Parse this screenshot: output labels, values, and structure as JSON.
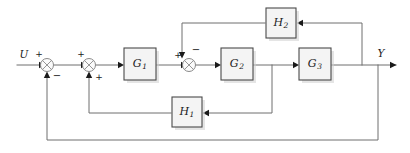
{
  "diagram": {
    "type": "control-system-block-diagram",
    "title": "",
    "input_label": "U",
    "output_label": "Y",
    "colors": {
      "background": "#ffffff",
      "wire": "#6f6f6f",
      "block_fill": "#f4f4f4",
      "block_stroke": "#4a4a4a",
      "sum_stroke": "#8a8a8a",
      "text": "#1a1a1a"
    },
    "blocks": [
      {
        "id": "G1",
        "label": "G",
        "subscript": "1",
        "x": 124,
        "y": 48,
        "w": 32,
        "h": 32
      },
      {
        "id": "G2",
        "label": "G",
        "subscript": "2",
        "x": 221,
        "y": 48,
        "w": 32,
        "h": 32
      },
      {
        "id": "G3",
        "label": "G",
        "subscript": "3",
        "x": 299,
        "y": 48,
        "w": 32,
        "h": 32
      },
      {
        "id": "H1",
        "label": "H",
        "subscript": "1",
        "x": 172,
        "y": 97,
        "w": 30,
        "h": 30
      },
      {
        "id": "H2",
        "label": "H",
        "subscript": "2",
        "x": 266,
        "y": 8,
        "w": 30,
        "h": 30
      }
    ],
    "summing_junctions": [
      {
        "id": "sum1",
        "cx": 47,
        "cy": 65,
        "r": 6.5,
        "signs": [
          {
            "value": "+",
            "position": "top-left"
          },
          {
            "value": "−",
            "position": "bottom-right"
          }
        ]
      },
      {
        "id": "sum2",
        "cx": 89,
        "cy": 65,
        "r": 6.5,
        "signs": [
          {
            "value": "+",
            "position": "top-left"
          },
          {
            "value": "+",
            "position": "bottom-right"
          }
        ]
      },
      {
        "id": "sum3",
        "cx": 189,
        "cy": 65,
        "r": 6.5,
        "signs": [
          {
            "value": "+",
            "position": "left"
          },
          {
            "value": "−",
            "position": "top-right"
          }
        ]
      }
    ],
    "signals": [
      {
        "id": "input",
        "label": "U",
        "from": "external-input",
        "to": "sum1"
      },
      {
        "id": "output",
        "label": "Y",
        "from": "G3",
        "to": "external-output"
      }
    ],
    "feedback_paths": [
      {
        "id": "inner-H2",
        "block": "H2",
        "from": "G3-output",
        "to": "sum3",
        "sign": "−"
      },
      {
        "id": "mid-H1",
        "block": "H1",
        "from": "G2-output",
        "to": "sum2",
        "sign": "+"
      },
      {
        "id": "outer",
        "block": "direct",
        "from": "output",
        "to": "sum1",
        "sign": "−"
      }
    ],
    "signs": {
      "plus": "+",
      "minus": "−"
    }
  }
}
